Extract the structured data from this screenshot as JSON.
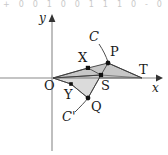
{
  "figure": {
    "title_strip": "+ 0 0 1 0 0 1 1 1 0 - 0",
    "axes": {
      "x_label": "x",
      "y_label": "y",
      "origin_label": "O",
      "x_axis_name": "horizontal-axis",
      "y_axis_name": "vertical-axis",
      "x_arrow": "arrow-right",
      "y_arrow": "arrow-up"
    },
    "colors": {
      "stroke": "#2b2b2b",
      "fill_upper": "#b9b9b9",
      "fill_lower": "#cfcfcf",
      "axis": "#8a8a8a",
      "background": "#ffffff"
    },
    "points": [
      {
        "id": "O",
        "label": "O",
        "x": 53,
        "y": 78,
        "dot": false,
        "label_x": 44,
        "label_y": 84
      },
      {
        "id": "X",
        "label": "X",
        "x": 88,
        "y": 68,
        "dot": true,
        "label_x": 80,
        "label_y": 57
      },
      {
        "id": "P",
        "label": "P",
        "x": 108,
        "y": 63,
        "dot": true,
        "label_x": 111,
        "label_y": 52
      },
      {
        "id": "T",
        "label": "T",
        "x": 142,
        "y": 78,
        "dot": false,
        "label_x": 140,
        "label_y": 70
      },
      {
        "id": "S",
        "label": "S",
        "x": 101,
        "y": 75,
        "dot": true,
        "label_x": 103,
        "label_y": 86
      },
      {
        "id": "Y",
        "label": "Y",
        "x": 71,
        "y": 84,
        "dot": true,
        "label_x": 66,
        "label_y": 96
      },
      {
        "id": "Q",
        "label": "Q",
        "x": 88,
        "y": 98,
        "dot": true,
        "label_x": 93,
        "label_y": 108
      },
      {
        "id": "C",
        "label": "C",
        "x": 97,
        "y": 38,
        "dot": false,
        "label_x": 91,
        "label_y": 43
      },
      {
        "id": "Cp",
        "label": "C'",
        "x": 70,
        "y": 113,
        "dot": false,
        "label_x": 65,
        "label_y": 119
      }
    ],
    "shapes": [
      {
        "name": "parallelogram-OXPT",
        "vertices": "53,78 88,68 108,63 142,78"
      },
      {
        "name": "triangle-OYQS",
        "vertices": "53,78 71,84 88,98 101,75"
      }
    ],
    "curves": [
      {
        "name": "leader-C-to-P",
        "from": "C",
        "to": "P"
      },
      {
        "name": "leader-Cprime-to-Q",
        "from": "C'",
        "to": "Q"
      }
    ]
  }
}
